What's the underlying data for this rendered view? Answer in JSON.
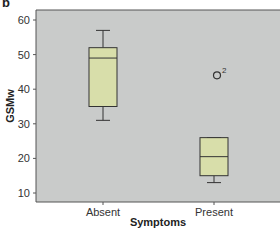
{
  "panel_label": "b",
  "chart_data": {
    "type": "box",
    "title": "",
    "xlabel": "Symptoms",
    "ylabel": "GSMw",
    "categories": [
      "Absent",
      "Present"
    ],
    "ylim": [
      7.5,
      62.5
    ],
    "yticks": [
      10,
      20,
      30,
      40,
      50,
      60
    ],
    "grid": false,
    "legend": null,
    "series": [
      {
        "name": "Absent",
        "whisker_low": 31,
        "q1": 35,
        "median": 49,
        "q3": 52,
        "whisker_high": 57,
        "outliers": []
      },
      {
        "name": "Present",
        "whisker_low": 13,
        "q1": 15,
        "median": 20.5,
        "q3": 26,
        "whisker_high": 26,
        "outliers": [
          {
            "value": 44,
            "label": "2"
          }
        ]
      }
    ],
    "colors": {
      "plot_bg": "#c9cbca",
      "box_fill": "#d8deaa",
      "stroke": "#333333"
    }
  }
}
